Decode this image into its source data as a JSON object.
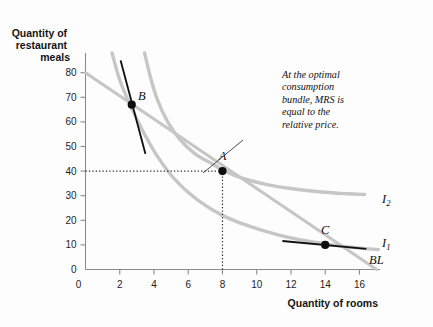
{
  "chart_data": {
    "type": "line",
    "title": "",
    "xlabel": "Quantity of rooms",
    "ylabel": "Quantity of restaurant meals",
    "xlim": [
      0,
      17.2
    ],
    "ylim": [
      0,
      88
    ],
    "xticks": [
      0,
      2,
      4,
      6,
      8,
      10,
      12,
      14,
      16
    ],
    "yticks": [
      0,
      10,
      20,
      30,
      40,
      50,
      60,
      70,
      80
    ],
    "grid": false,
    "legend_position": "inline-right",
    "series": [
      {
        "name": "BL",
        "label": "BL",
        "type": "budget-line",
        "color": "#c6c6c6",
        "points": [
          [
            0,
            80
          ],
          [
            17.0,
            0
          ]
        ]
      },
      {
        "name": "I1",
        "label": "I",
        "sublabel": "1",
        "type": "indifference-curve",
        "color": "#c6c6c6",
        "points": [
          [
            1.55,
            88
          ],
          [
            2.0,
            77
          ],
          [
            2.6,
            67
          ],
          [
            3.3,
            57
          ],
          [
            4.2,
            46
          ],
          [
            5.3,
            36
          ],
          [
            6.6,
            28
          ],
          [
            8.0,
            22
          ],
          [
            9.6,
            17.5
          ],
          [
            11.3,
            14
          ],
          [
            13.0,
            11.5
          ],
          [
            14.6,
            9.8
          ],
          [
            16.2,
            8.6
          ],
          [
            17.1,
            8.1
          ]
        ]
      },
      {
        "name": "I2",
        "label": "I",
        "sublabel": "2",
        "type": "indifference-curve",
        "color": "#c6c6c6",
        "points": [
          [
            3.45,
            88
          ],
          [
            3.8,
            78
          ],
          [
            4.2,
            69
          ],
          [
            4.8,
            60
          ],
          [
            5.5,
            53
          ],
          [
            6.4,
            47
          ],
          [
            7.4,
            43
          ],
          [
            8.0,
            40.5
          ],
          [
            9.2,
            37
          ],
          [
            10.6,
            34.5
          ],
          [
            12.2,
            32.7
          ],
          [
            13.8,
            31.5
          ],
          [
            15.3,
            30.8
          ],
          [
            16.3,
            30.5
          ]
        ]
      }
    ],
    "points": [
      {
        "label": "B",
        "x": 2.7,
        "y": 67,
        "label_dx": 10,
        "label_dy": -5
      },
      {
        "label": "A",
        "x": 8.0,
        "y": 40,
        "label_dx": 0,
        "label_dy": -11
      },
      {
        "label": "C",
        "x": 14.0,
        "y": 10,
        "label_dx": 0,
        "label_dy": -11
      }
    ],
    "tangents": [
      {
        "at": "B",
        "points": [
          [
            2.05,
            85
          ],
          [
            3.5,
            47
          ]
        ],
        "color": "#111"
      },
      {
        "at": "C",
        "points": [
          [
            11.5,
            11.6
          ],
          [
            16.4,
            8.4
          ]
        ],
        "color": "#111"
      }
    ],
    "guides": [
      {
        "type": "horizontal",
        "from": [
          0,
          40
        ],
        "to": [
          8,
          40
        ]
      },
      {
        "type": "vertical",
        "from": [
          8,
          0
        ],
        "to": [
          8,
          40
        ]
      }
    ],
    "annotations": [
      {
        "name": "optimal-bundle-note",
        "lines": [
          "At the optimal",
          "consumption",
          "bundle, MRS is",
          "equal to the",
          "relative price."
        ],
        "x": 282,
        "y": 78,
        "leader_from": [
          243,
          140
        ],
        "leader_to": [
          203,
          173
        ]
      }
    ],
    "curve_labels": [
      {
        "name": "I2",
        "text": "I",
        "sub": "2",
        "x": 382,
        "y": 203
      },
      {
        "name": "I1",
        "text": "I",
        "sub": "1",
        "x": 382,
        "y": 247
      },
      {
        "name": "BL",
        "text": "BL",
        "sub": "",
        "x": 369,
        "y": 264
      }
    ],
    "colors": {
      "background": "#fdfdfd",
      "curve": "#c6c6c6",
      "tangent": "#111111",
      "axis": "#8b8b8b",
      "point": "#0d0d0d",
      "text": "#141414"
    }
  }
}
